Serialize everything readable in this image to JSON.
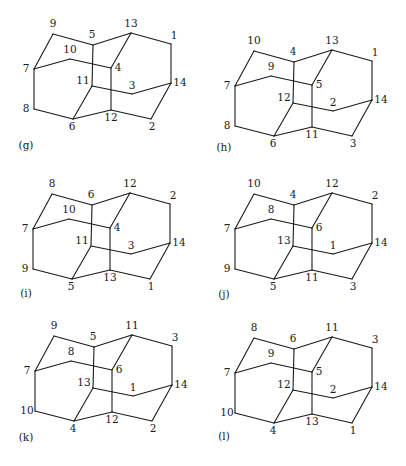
{
  "figure": {
    "panels": [
      {
        "id": "g",
        "caption": "(g)",
        "offset": [
          0,
          0
        ],
        "caption_pos": [
          26,
          149
        ],
        "labels": {
          "A": "9",
          "B": "5",
          "C": "13",
          "D": "1",
          "E": "10",
          "F": "7",
          "G": "4",
          "H": "11",
          "I": "3",
          "J": "14",
          "K": "8",
          "L": "6",
          "M": "12",
          "N": "2"
        }
      },
      {
        "id": "h",
        "caption": "(h)",
        "offset": [
          201,
          17
        ],
        "caption_pos": [
          224,
          151
        ],
        "labels": {
          "A": "10",
          "B": "4",
          "C": "13",
          "D": "1",
          "E": "9",
          "F": "7",
          "G": "5",
          "H": "12",
          "I": "2",
          "J": "14",
          "K": "8",
          "L": "6",
          "M": "11",
          "N": "3"
        }
      },
      {
        "id": "i",
        "caption": "(i)",
        "offset": [
          -1,
          160
        ],
        "caption_pos": [
          26,
          297
        ],
        "labels": {
          "A": "8",
          "B": "6",
          "C": "12",
          "D": "2",
          "E": "10",
          "F": "7",
          "G": "4",
          "H": "11",
          "I": "3",
          "J": "14",
          "K": "9",
          "L": "5",
          "M": "13",
          "N": "1"
        }
      },
      {
        "id": "j",
        "caption": "(j)",
        "offset": [
          201,
          160
        ],
        "caption_pos": [
          224,
          298
        ],
        "labels": {
          "A": "10",
          "B": "4",
          "C": "12",
          "D": "2",
          "E": "8",
          "F": "7",
          "G": "6",
          "H": "13",
          "I": "1",
          "J": "14",
          "K": "9",
          "L": "5",
          "M": "11",
          "N": "3"
        }
      },
      {
        "id": "k",
        "caption": "(k)",
        "offset": [
          1,
          302
        ],
        "caption_pos": [
          26,
          441
        ],
        "labels": {
          "A": "9",
          "B": "5",
          "C": "11",
          "D": "3",
          "E": "8",
          "F": "7",
          "G": "6",
          "H": "13",
          "I": "1",
          "J": "14",
          "K": "10",
          "L": "4",
          "M": "12",
          "N": "2"
        }
      },
      {
        "id": "l",
        "caption": "(l)",
        "offset": [
          201,
          304
        ],
        "caption_pos": [
          224,
          440
        ],
        "labels": {
          "A": "8",
          "B": "6",
          "C": "11",
          "D": "3",
          "E": "9",
          "F": "7",
          "G": "5",
          "H": "12",
          "I": "2",
          "J": "14",
          "K": "10",
          "L": "4",
          "M": "13",
          "N": "1"
        }
      }
    ],
    "geometry": {
      "vertices": {
        "A": [
          53,
          34
        ],
        "B": [
          93,
          45
        ],
        "C": [
          131,
          33
        ],
        "D": [
          171,
          44
        ],
        "E": [
          70,
          59
        ],
        "F": [
          34,
          69
        ],
        "G": [
          111,
          68
        ],
        "H": [
          92,
          86
        ],
        "I": [
          132,
          94
        ],
        "J": [
          171,
          83
        ],
        "K": [
          34,
          109
        ],
        "L": [
          73,
          119
        ],
        "M": [
          111,
          110
        ],
        "N": [
          151,
          119
        ]
      },
      "label_offsets": {
        "A": [
          0,
          -7
        ],
        "B": [
          -1,
          -7
        ],
        "C": [
          0,
          -6
        ],
        "D": [
          3,
          -5
        ],
        "E": [
          0,
          -6
        ],
        "F": [
          -8,
          3
        ],
        "G": [
          7,
          3
        ],
        "H": [
          -9,
          -2
        ],
        "I": [
          0,
          -5
        ],
        "J": [
          9,
          3
        ],
        "K": [
          -8,
          3
        ],
        "L": [
          -1,
          11
        ],
        "M": [
          0,
          11
        ],
        "N": [
          1,
          11
        ]
      },
      "edges": [
        [
          "A",
          "B"
        ],
        [
          "B",
          "C"
        ],
        [
          "C",
          "D"
        ],
        [
          "D",
          "J"
        ],
        [
          "A",
          "F"
        ],
        [
          "F",
          "E"
        ],
        [
          "E",
          "G"
        ],
        [
          "C",
          "G"
        ],
        [
          "G",
          "M"
        ],
        [
          "B",
          "H"
        ],
        [
          "H",
          "I"
        ],
        [
          "I",
          "J"
        ],
        [
          "J",
          "N"
        ],
        [
          "F",
          "K"
        ],
        [
          "K",
          "L"
        ],
        [
          "L",
          "H"
        ],
        [
          "L",
          "M"
        ],
        [
          "M",
          "N"
        ]
      ]
    }
  }
}
